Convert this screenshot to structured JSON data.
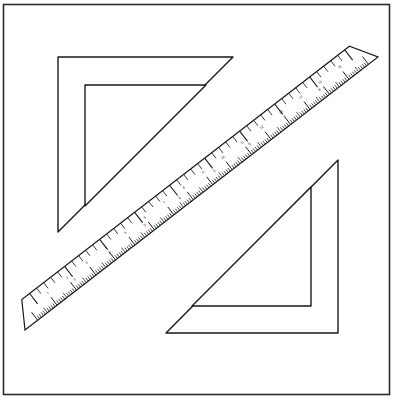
{
  "scene": {
    "title": "Drafting Instruments Line Drawing",
    "background_color": "#ffffff",
    "stroke_color": "#1a1a1a",
    "width": 409,
    "height": 406
  },
  "frame": {
    "name": "image-border-frame",
    "x": 3.5,
    "y": 4.5,
    "width": 386,
    "height": 390,
    "stroke_width": 1.6,
    "color": "#2b2b2b"
  },
  "objects": [
    {
      "id": "set-square-top-left",
      "label": "45 degree set square (upper left)",
      "type": "triangle-ruler",
      "right_angle_corner": "top-left",
      "outer_points": "58,57 233,57 58,232",
      "inner_points": "85,85 206,85 85,206",
      "stroke_width": 1.4
    },
    {
      "id": "set-square-bottom-right",
      "label": "45 degree set square (lower right)",
      "type": "triangle-ruler",
      "right_angle_corner": "bottom-right",
      "outer_points": "338,160 338,333 166,333",
      "inner_points": "311,187 311,306 192,306",
      "stroke_width": 1.4
    },
    {
      "id": "ruler-diagonal",
      "label": "Graduated straight ruler",
      "type": "ruler",
      "orientation": "diagonal-45",
      "tip_start": "25,330",
      "tip_end": "378,57",
      "body_width": 26,
      "stroke_width": 1.2
    }
  ],
  "ruler_scale": {
    "name": "ruler-graduations",
    "top_edge": {
      "label": "centimetre scale (upper-left edge)",
      "major_tick_count": 9,
      "minor_per_major": 5,
      "major_length": 13,
      "minor_length": 7,
      "numerals": [
        "1",
        "2",
        "3",
        "4",
        "5",
        "6",
        "7",
        "8"
      ]
    },
    "bottom_edge": {
      "label": "millimetre scale (lower-right edge)",
      "major_tick_count": 17,
      "minor_per_major": 10,
      "major_length": 10,
      "minor_length": 4,
      "numerals": [
        "1",
        "2",
        "3",
        "4",
        "5",
        "6",
        "7",
        "8",
        "9",
        "10",
        "11",
        "12",
        "13",
        "14",
        "15",
        "16"
      ]
    }
  },
  "icons": {
    "ruler_icon": "ruler-icon",
    "triangle_icon": "triangle-icon"
  }
}
